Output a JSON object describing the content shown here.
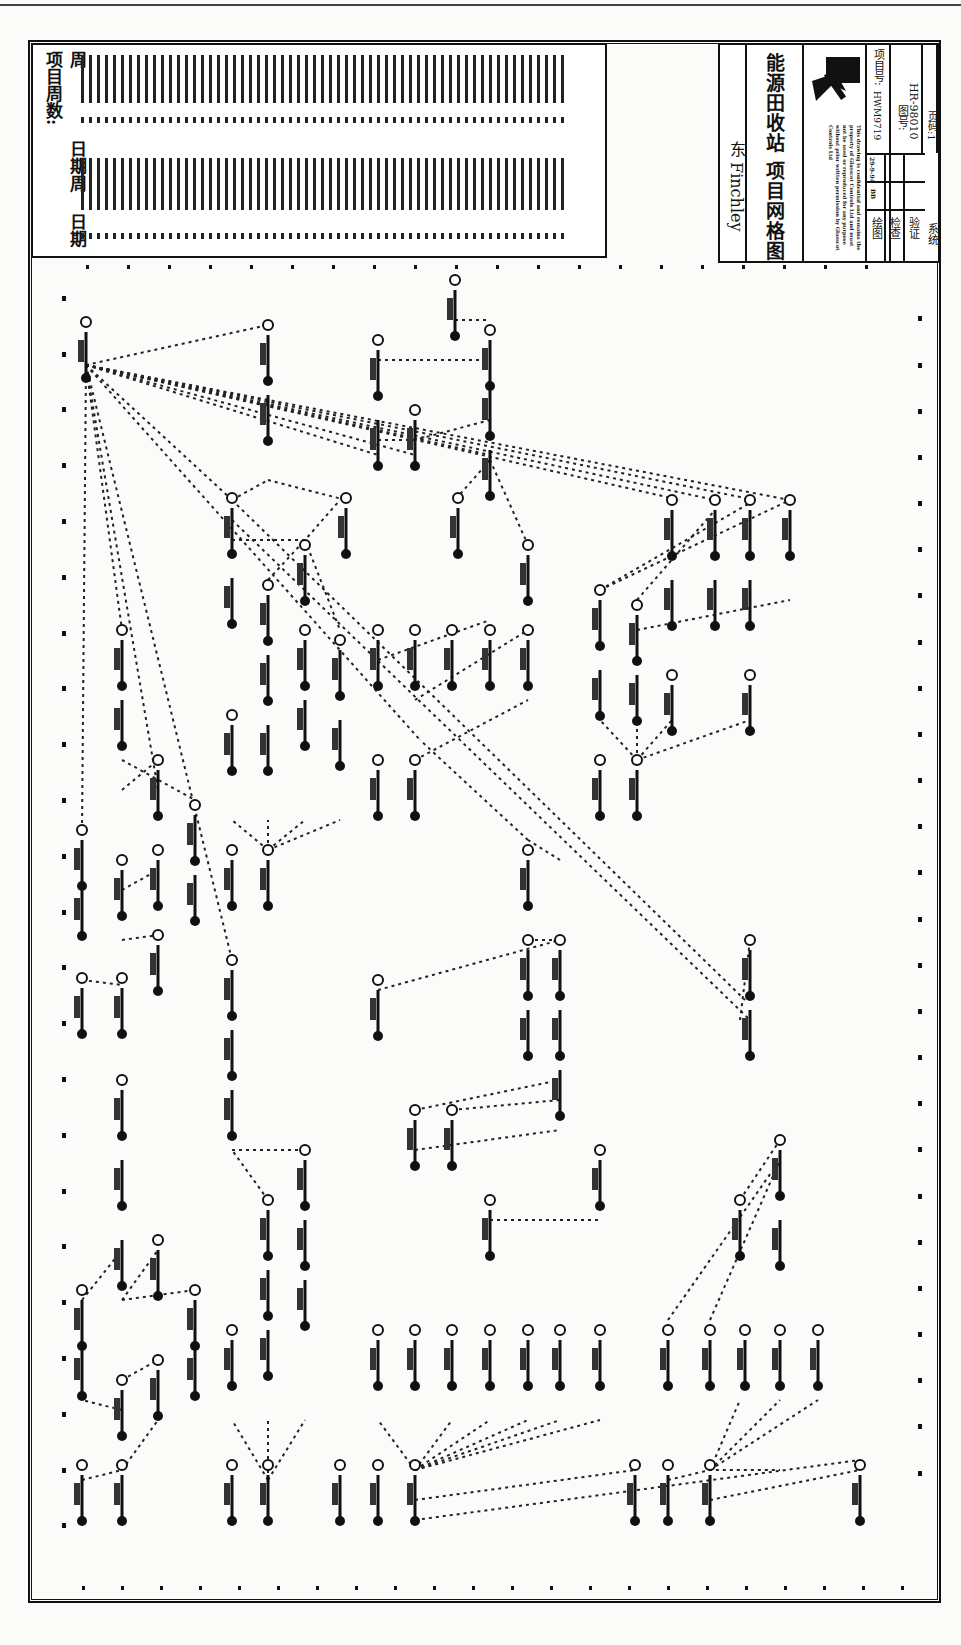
{
  "legend": {
    "header": "项目周数:",
    "col_week_1": "周",
    "col_date_1": "日期",
    "col_week_2": "周",
    "col_date_2": "日期",
    "note": "week/date entries illegible at this resolution"
  },
  "title_block": {
    "location": "东 Finchley",
    "title": "能源田收站 项目网格图",
    "company_line": "GLASSCOT CONTROLS LTD",
    "copyright_text": "This drawing is confidential and remains the property of Glasscot Controls Ltd and must not be used or reproduced for any purpose without prior written permission by Glasscot Controls Ltd",
    "project_no_label": "项目号:",
    "project_no": "HWM9719",
    "drawing_no_label": "图号:",
    "drawing_no": "HR-98010",
    "page_label": "页码:1",
    "drawn_label": "绘图",
    "checked_label": "检查",
    "verified_label": "验证",
    "system_label": "系统",
    "drawn_initials": "BB",
    "drawn_date": "29-9-94"
  },
  "diagram": {
    "type": "project network (PERT) diagram, rotated 90°",
    "line_style": "dotted dependency links between activity nodes",
    "node_glyph": "circled event numbers with vertical activity bars",
    "ink_color": "#111111",
    "paper_color": "#fbfbfa"
  }
}
